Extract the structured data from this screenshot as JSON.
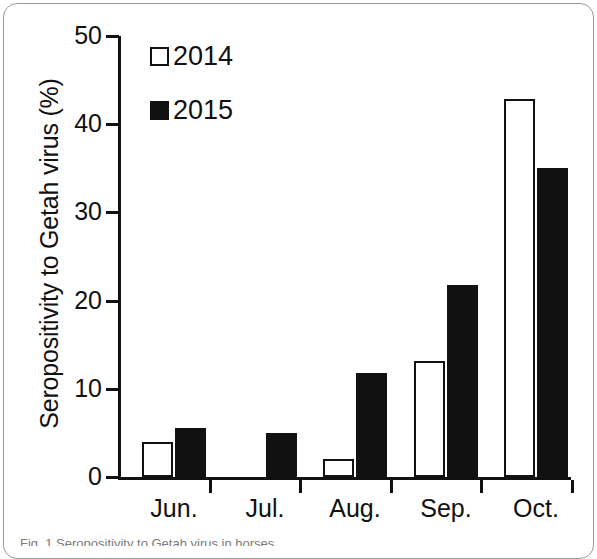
{
  "figure": {
    "caption": "Fig. 1 Seropositivity to Getah virus in horses"
  },
  "legend": {
    "position": "top-left-inside",
    "entries": [
      {
        "label": "2014",
        "swatch": "open-square",
        "color": "#ffffff"
      },
      {
        "label": "2015",
        "swatch": "filled-square",
        "color": "#111111"
      }
    ]
  },
  "chart_data": {
    "type": "bar",
    "title": "",
    "subtitle": "",
    "xlabel": "",
    "ylabel": "Seropositivity to Getah virus (%)",
    "categories": [
      "Jun.",
      "Jul.",
      "Aug.",
      "Sep.",
      "Oct."
    ],
    "series": [
      {
        "name": "2014",
        "values": [
          4.0,
          0,
          2.0,
          13.1,
          42.9
        ]
      },
      {
        "name": "2015",
        "values": [
          5.5,
          5.0,
          11.8,
          21.8,
          35.0
        ]
      }
    ],
    "ylim": [
      0,
      50
    ],
    "yticks": [
      0,
      10,
      20,
      30,
      40,
      50
    ],
    "ytick_labels": [
      "0",
      "10",
      "20",
      "30",
      "40",
      "50"
    ],
    "grid": false,
    "legend_position": "upper left"
  }
}
